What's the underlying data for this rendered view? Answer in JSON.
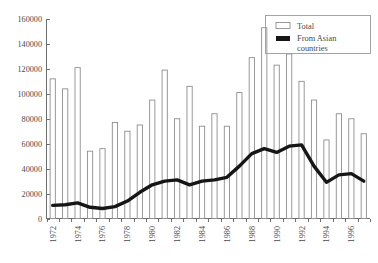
{
  "chart_data": {
    "type": "bar",
    "title": "",
    "xlabel": "",
    "ylabel": "",
    "ylim": [
      0,
      160000
    ],
    "ytick_values": [
      0,
      20000,
      40000,
      60000,
      80000,
      100000,
      120000,
      140000,
      160000
    ],
    "ytick_labels": [
      "0",
      "20000",
      "40000",
      "60000",
      "80000",
      "100000",
      "120000",
      "140000",
      "160000"
    ],
    "grid": false,
    "legend_position": "top-right",
    "categories": [
      "1972",
      "1973",
      "1974",
      "1975",
      "1976",
      "1977",
      "1978",
      "1979",
      "1980",
      "1981",
      "1982",
      "1983",
      "1984",
      "1985",
      "1986",
      "1987",
      "1988",
      "1989",
      "1990",
      "1991",
      "1992",
      "1993",
      "1994",
      "1995",
      "1996",
      "1997"
    ],
    "xtick_labels_shown": [
      "1972",
      "1974",
      "1976",
      "1978",
      "1980",
      "1982",
      "1984",
      "1986",
      "1988",
      "1990",
      "1992",
      "1994",
      "1996"
    ],
    "series": [
      {
        "name": "Total",
        "render": "bar",
        "values": [
          112000,
          104000,
          121000,
          54000,
          56000,
          77000,
          70000,
          75000,
          95000,
          119000,
          80000,
          106000,
          74000,
          84000,
          74000,
          101000,
          129000,
          153000,
          123000,
          132000,
          110000,
          95000,
          63000,
          84000,
          80000,
          68000
        ]
      },
      {
        "name": "From Asian countries",
        "render": "line",
        "values": [
          10500,
          11000,
          12500,
          9000,
          8000,
          9500,
          14000,
          21000,
          27000,
          30000,
          31000,
          27000,
          30000,
          31000,
          33000,
          42000,
          52000,
          56000,
          53000,
          58000,
          59000,
          42000,
          29000,
          35000,
          36000,
          30000
        ]
      }
    ],
    "legend_entries": [
      {
        "label": "Total",
        "swatch": "open-bar"
      },
      {
        "label": "From Asian countries",
        "swatch": "black-line"
      }
    ],
    "colors": {
      "bar_fill": "#ffffff",
      "bar_stroke": "#8e8e8e",
      "line": "#161616",
      "axis": "#6f6f6f",
      "text": "#4a4a4a",
      "background": "#ffffff"
    }
  }
}
